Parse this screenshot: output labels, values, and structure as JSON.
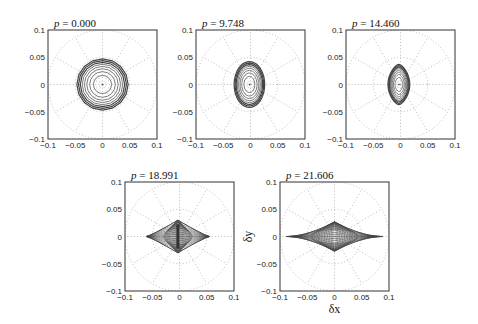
{
  "chart_data": [
    {
      "type": "line",
      "title": "p = 0.000",
      "p": 0.0,
      "xlabel": "",
      "ylabel": "",
      "xlim": [
        -0.1,
        0.1
      ],
      "ylim": [
        -0.1,
        0.1
      ],
      "xticks": [
        "-0.1",
        "-0.05",
        "0",
        "0.05",
        "0.1"
      ],
      "yticks": [
        "0.1",
        "0.05",
        "0",
        "-0.05",
        "-0.1"
      ],
      "grid": "polar-dotted",
      "shape": "circle",
      "contours": {
        "count": 8,
        "rx_max": 0.047,
        "ry_max": 0.047,
        "cx": 0.0,
        "cy": 0.0
      }
    },
    {
      "type": "line",
      "title": "p = 9.748",
      "p": 9.748,
      "xlabel": "",
      "ylabel": "",
      "xlim": [
        -0.1,
        0.1
      ],
      "ylim": [
        -0.1,
        0.1
      ],
      "xticks": [
        "-0.1",
        "-0.05",
        "0",
        "0.05",
        "0.1"
      ],
      "yticks": [
        "0.1",
        "0.05",
        "0",
        "-0.05",
        "-0.1"
      ],
      "grid": "polar-dotted",
      "shape": "ellipse",
      "contours": {
        "count": 8,
        "rx_max": 0.028,
        "ry_max": 0.042,
        "cx": -0.002,
        "cy": 0.0
      }
    },
    {
      "type": "line",
      "title": "p = 14.460",
      "p": 14.46,
      "xlabel": "",
      "ylabel": "",
      "xlim": [
        -0.1,
        0.1
      ],
      "ylim": [
        -0.1,
        0.1
      ],
      "xticks": [
        "-0.1",
        "-0.05",
        "0",
        "0.05",
        "0.1"
      ],
      "yticks": [
        "0.1",
        "0.05",
        "0",
        "-0.05",
        "-0.1"
      ],
      "grid": "polar-dotted",
      "shape": "pointed-ellipse",
      "contours": {
        "count": 8,
        "rx_max": 0.02,
        "ry_max": 0.037,
        "cx": -0.003,
        "cy": 0.0
      }
    },
    {
      "type": "line",
      "title": "p = 18.991",
      "p": 18.991,
      "xlabel": "",
      "ylabel": "",
      "xlim": [
        -0.1,
        0.1
      ],
      "ylim": [
        -0.1,
        0.1
      ],
      "xticks": [
        "-0.1",
        "-0.05",
        "0",
        "0.05",
        "0.1"
      ],
      "yticks": [
        "0.1",
        "0.05",
        "0",
        "-0.05",
        "-0.1"
      ],
      "grid": "polar-dotted",
      "shape": "diamond-mesh",
      "contours": {
        "count": 12,
        "rx_max": 0.058,
        "ry_max": 0.03,
        "cx": -0.003,
        "cy": 0.0
      }
    },
    {
      "type": "line",
      "title": "p = 21.606",
      "p": 21.606,
      "xlabel": "δx",
      "ylabel": "δy",
      "xlim": [
        -0.1,
        0.1
      ],
      "ylim": [
        -0.1,
        0.1
      ],
      "xticks": [
        "-0.1",
        "-0.05",
        "0",
        "0.05",
        "0.1"
      ],
      "yticks": [
        "0.1",
        "0.05",
        "0",
        "-0.05",
        "-0.1"
      ],
      "grid": "polar-dotted",
      "shape": "lens-mesh",
      "contours": {
        "count": 14,
        "rx_max": 0.088,
        "ry_max": 0.027,
        "cx": 0.0,
        "cy": 0.0
      }
    }
  ],
  "panels": [
    {
      "x": 48,
      "y": 30,
      "size": 109
    },
    {
      "x": 196,
      "y": 30,
      "size": 109
    },
    {
      "x": 346,
      "y": 30,
      "size": 109
    },
    {
      "x": 125,
      "y": 182,
      "size": 109
    },
    {
      "x": 280,
      "y": 182,
      "size": 109
    }
  ],
  "colors": {
    "axes": "#333333",
    "grid": "#aaaaaa",
    "curve": "#444444",
    "text": "#222222"
  }
}
